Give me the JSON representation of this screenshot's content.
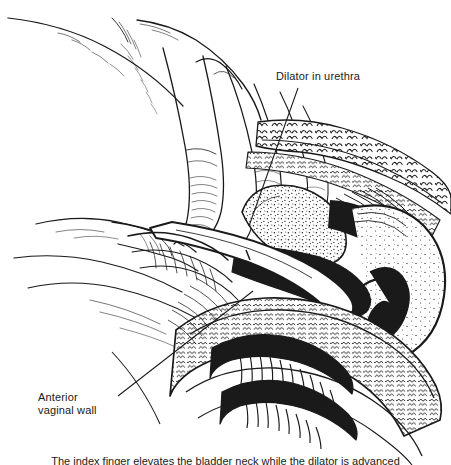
{
  "figure": {
    "kind": "medical-line-illustration",
    "technique": "pen-and-ink stipple and hatch",
    "background_color": "#ffffff",
    "ink_color": "#1a1a1a",
    "width": 451,
    "height": 465
  },
  "labels": [
    {
      "id": "dilator-in-urethra",
      "text": "Dilator in urethra",
      "x": 276,
      "y": 70,
      "leader": {
        "x1": 298,
        "y1": 88,
        "x2": 249,
        "y2": 226
      }
    },
    {
      "id": "anterior-vaginal-wall",
      "text": "Anterior\nvaginal wall",
      "x": 38,
      "y": 391,
      "leader": {
        "x1": 118,
        "y1": 396,
        "x2": 253,
        "y2": 291
      }
    }
  ],
  "caption": {
    "text": "The index finger elevates the bladder neck while the dilator is advanced"
  },
  "anatomy_parts": [
    "clinician hand and fingers",
    "thumb",
    "dilator instrument",
    "urethra",
    "bladder",
    "pubic symphysis",
    "anterior vaginal wall with rugae",
    "vaginal canal",
    "perineum",
    "subcutaneous fat and fascia"
  ]
}
